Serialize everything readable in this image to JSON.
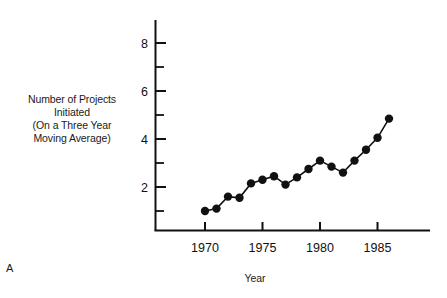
{
  "figure": {
    "panel_letter": "A",
    "ylabel_lines": [
      "Number of Projects",
      "Initiated",
      "(On a Three Year",
      "Moving Average)"
    ],
    "xlabel": "Year",
    "axis_color": "#111111",
    "marker_color": "#111111",
    "line_color": "#111111",
    "background": "#ffffff"
  },
  "chart_data": {
    "type": "line",
    "title": "",
    "xlabel": "Year",
    "ylabel": "Number of Projects Initiated (On a Three Year Moving Average)",
    "xlim": [
      1966.5,
      1987.5
    ],
    "ylim": [
      0,
      9.0
    ],
    "grid": false,
    "legend": null,
    "x_major_ticks": [
      1970,
      1975,
      1980,
      1985
    ],
    "x_tick_labels": [
      "1970",
      "1975",
      "1980",
      "1985"
    ],
    "y_major_ticks": [
      2,
      4,
      6,
      8
    ],
    "y_tick_labels": [
      "2",
      "4",
      "6",
      "8"
    ],
    "y_minor_ticks": [
      1,
      3,
      5,
      7
    ],
    "marker": "filled-circle",
    "x": [
      1970,
      1971,
      1972,
      1973,
      1974,
      1975,
      1976,
      1977,
      1978,
      1979,
      1980,
      1981,
      1982,
      1983,
      1984,
      1985,
      1986
    ],
    "values": [
      1.0,
      1.1,
      1.6,
      1.55,
      2.15,
      2.3,
      2.45,
      2.1,
      2.4,
      2.75,
      3.1,
      2.85,
      2.6,
      3.1,
      3.55,
      4.05,
      4.85
    ]
  }
}
